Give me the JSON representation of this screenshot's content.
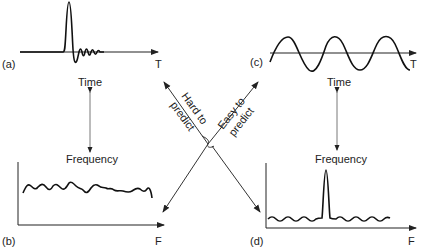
{
  "panels": {
    "a": {
      "tag": "(a)",
      "axis": "T",
      "desc": "transient pulse with decaying ringing"
    },
    "b": {
      "tag": "(b)",
      "axis": "F",
      "desc": "broadband noisy spectrum"
    },
    "c": {
      "tag": "(c)",
      "axis": "T",
      "desc": "sinusoidal wave"
    },
    "d": {
      "tag": "(d)",
      "axis": "F",
      "desc": "narrow spectral peak"
    }
  },
  "left_link": {
    "top": "Time",
    "bottom": "Frequency"
  },
  "right_link": {
    "top": "Time",
    "bottom": "Frequency"
  },
  "cross": {
    "hard_line1": "Hard to",
    "hard_line2": "predict",
    "easy_line1": "Easy to",
    "easy_line2": "predict"
  }
}
